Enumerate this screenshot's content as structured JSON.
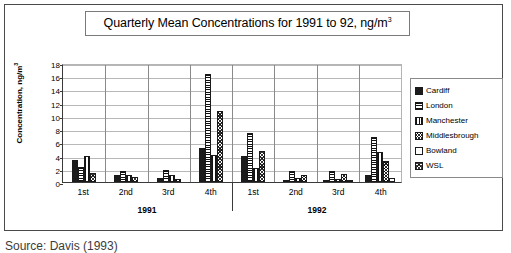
{
  "figure": {
    "title": "Quarterly Mean Concentrations for 1991 to 92, ng/m",
    "title_sup": "3",
    "source_caption": "Source: Davis (1993)"
  },
  "axes": {
    "ylabel_text": "Concentration, ng/m",
    "ylabel_sup": "3",
    "yticks": [
      "0",
      "2",
      "4",
      "6",
      "8",
      "10",
      "12",
      "14",
      "16",
      "18"
    ],
    "xticks": [
      "1st",
      "2nd",
      "3rd",
      "4th",
      "1st",
      "2nd",
      "3rd",
      "4th"
    ],
    "years": [
      "1991",
      "1992"
    ]
  },
  "legend": {
    "items": [
      {
        "label": "Cardiff",
        "pattern": "solid-black",
        "color": "#1c1c1c"
      },
      {
        "label": "London",
        "pattern": "horizontal-stripes",
        "color": "#111111"
      },
      {
        "label": "Manchester",
        "pattern": "vertical-stripes",
        "color": "#111111"
      },
      {
        "label": "Middlesbrough",
        "pattern": "cross-hatch",
        "color": "#2a2a2a"
      },
      {
        "label": "Bowland",
        "pattern": "empty-white",
        "color": "#ffffff"
      },
      {
        "label": "WSL",
        "pattern": "diagonal-cross-hatch",
        "color": "#3a3a3a"
      }
    ]
  },
  "chart_data": {
    "type": "bar",
    "title": "Quarterly Mean Concentrations for 1991 to 92, ng/m3",
    "xlabel": "",
    "ylabel": "Concentration, ng/m3",
    "ylim": [
      0,
      18
    ],
    "ytick_step": 2,
    "grid": true,
    "legend_position": "right",
    "categories": [
      "1st",
      "2nd",
      "3rd",
      "4th",
      "1st",
      "2nd",
      "3rd",
      "4th"
    ],
    "category_groups": [
      {
        "year": "1991",
        "quarters": [
          "1st",
          "2nd",
          "3rd",
          "4th"
        ]
      },
      {
        "year": "1992",
        "quarters": [
          "1st",
          "2nd",
          "3rd",
          "4th"
        ]
      }
    ],
    "series": [
      {
        "name": "Cardiff",
        "values": [
          3.4,
          1.1,
          0.6,
          5.1,
          3.9,
          0.2,
          0.1,
          1.0
        ]
      },
      {
        "name": "London",
        "values": [
          2.2,
          1.6,
          1.8,
          16.3,
          7.4,
          1.6,
          1.7,
          6.8
        ]
      },
      {
        "name": "Manchester",
        "values": [
          4.0,
          1.0,
          1.1,
          4.1,
          2.1,
          0.6,
          0.5,
          4.6
        ]
      },
      {
        "name": "Middlesbrough",
        "values": [
          0.0,
          0.0,
          0.0,
          0.0,
          0.0,
          1.0,
          1.2,
          3.2
        ]
      },
      {
        "name": "Bowland",
        "values": [
          0.0,
          0.0,
          0.0,
          0.0,
          0.0,
          0.0,
          0.1,
          0.6
        ]
      },
      {
        "name": "WSL",
        "values": [
          1.3,
          0.7,
          0.5,
          10.7,
          4.7,
          0.0,
          0.0,
          0.0
        ]
      }
    ]
  }
}
